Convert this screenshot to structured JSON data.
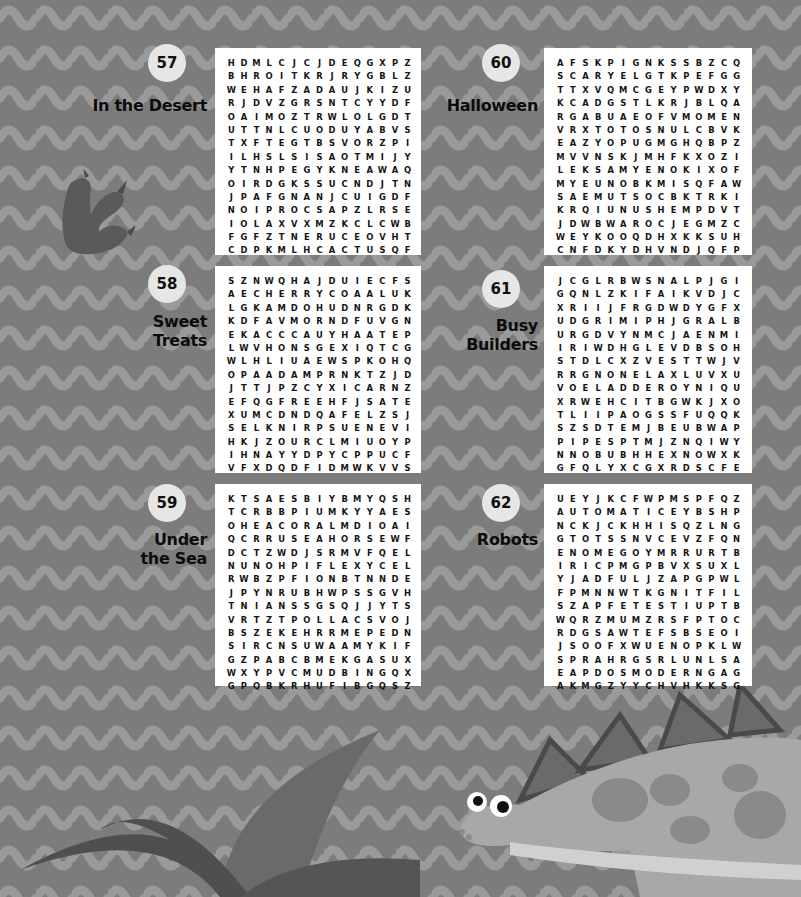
{
  "page": {
    "background_color": "#7c7c7c",
    "panel_color": "#ffffff",
    "badge_color": "#e6e6e6"
  },
  "puzzles": [
    {
      "number": "57",
      "title": "In the Desert",
      "grid": [
        "HDMLCJCJDEQGXPZ",
        "BHROITKRJRYGBLZ",
        "WEHAFZADAUJKIZU",
        "RJDVZGRSNTCYYDF",
        "OAIMOZTRWLOLGDT",
        "UTTNLCUODUYABVS",
        "TXFTEGTBSVORZPI",
        "ILHSLSISAOTMIJY",
        "YTNHPEGYKNEAWAQ",
        "OIRDGKSSUCNDJTN",
        "JPAFGNANJCUIGDF",
        "NOIPROCSAPZLRSE",
        "IOLAXVXMZKCLCWB",
        "FGFZTNERUCEOVHT",
        "CDPKMLHCACTUSQF"
      ],
      "found_words": [
        "CACTUS",
        "SCORPION",
        "OASIS",
        "CAMEL",
        "DUNE",
        "RATTLESNAKE",
        "HEAT",
        "COYOTE",
        "DRY",
        "LIZARD",
        "VULTURE",
        "DESERT",
        "SUN"
      ]
    },
    {
      "number": "58",
      "title": "Sweet Treats",
      "grid": [
        "SZNWQHAJDUIECFS",
        "AECHERRYCOAALUK",
        "LGKAMDOHUDNRGDK",
        "KDFAVMORNDFUVGN",
        "EKACCCAUYHAATEP",
        "LWVHONSGEXIQTCG",
        "WLHLIUAEWSPKOHQ",
        "OPAADAMPRNKTZJD",
        "JTTJPZCYXICARNZ",
        "EFQGFREEHFJSATE",
        "XUMCDNDQAFELZSJ",
        "SELKNIRPSUENEVI",
        "HKJZOURCLMIUOYP",
        "IHNAYYDPYCPPUCF",
        "VFXDQDFIDMWKVVS"
      ],
      "found_words": [
        "CHERRY",
        "CAKE",
        "SPRINKLES",
        "FUDGE",
        "MUFFINS",
        "PIE",
        "CANDY",
        "CUPCAKE",
        "DONUT",
        "CARAMEL",
        "SALTED",
        "ICECREAM",
        "CHOCOLATE"
      ]
    },
    {
      "number": "59",
      "title": "Under the Sea",
      "grid": [
        "KTSAESBIYBMYQSH",
        "TCRBBPIUMKYYAES",
        "OHEACORALMDIOAI",
        "QCRRUSEAHORSEWF",
        "DCTZWDJSRMVFQEL",
        "NUNOHPIFLEXYCEL",
        "RWBZPFIONBTNNDE",
        "JPYNRUBHWPSSGVH",
        "TNIANSSGSQJJYTS",
        "VRTZTPOLLACSVOJ",
        "BSZEKEHRRMEPEDN",
        "SIRCNSUWAAMYKIF",
        "GZPABCBMEKGASUX",
        "WXYPVCMUDBINGQX",
        "GPQBKRHUFIBGQSZ"
      ],
      "found_words": [
        "CORAL",
        "SEAHORSE",
        "POLLACS",
        "SEAWEED",
        "SHELLFISH",
        "SQUID",
        "OCTOPUS",
        "URCHINS",
        "STARFISH",
        "SHRIMP",
        "SPONGES"
      ]
    },
    {
      "number": "60",
      "title": "Halloween",
      "grid": [
        "AFSKPIGNKSSBZCQ",
        "SCARYELGTKPEFGG",
        "TTXVQMCGEYPWDXY",
        "KCADGSTLKRJBLQA",
        "RGABUAEOFVMOMEN",
        "VRXTOTOSNULCBVK",
        "EAZYOPUGMGHQBPZ",
        "MVVNSKJMHFKXOZI",
        "LEKSAMYENOKIXOF",
        "MYEUNOBKMISQFAW",
        "SAEMUTSOCBKTRKI",
        "KRQIUNUSHEMPDVT",
        "JDWBWAROCJEGMZC",
        "WEYKOOQDHXKKSUH",
        "CNFDKYDHVNDJQFP"
      ],
      "found_words": [
        "SCARY",
        "MASKS",
        "COSTUME",
        "GRAVEYARD",
        "WITCH",
        "WEB",
        "CAT",
        "SPOOKY",
        "GHOST",
        "MUMMY",
        "PUMPKIN",
        "BOO",
        "NIGHT"
      ]
    },
    {
      "number": "61",
      "title": "Busy Builders",
      "grid": [
        "JCGLRBWSNALPJGI",
        "GQNLZKIFAIKVDJC",
        "XRIIJFRGDWDYGFX",
        "UDGRIMIPHJGRALB",
        "URGDVYNMCJAENMI",
        "IRIWDHGLEVDBSOH",
        "STDLCXZVESTTWJV",
        "RRGNONELAXLUVXU",
        "VOELADDEROYNIQU",
        "XRWEHCITBGWKJXO",
        "TLIIPAOGSSFUQQK",
        "SZSDTEMJBEUBWAP",
        "PIPESPTMJZNQIWY",
        "NNOBUBHHEXNOWXK",
        "GFQLYXCGXRDSCFE"
      ],
      "found_words": [
        "PLANS",
        "LADDER",
        "PIPES",
        "DIGGING",
        "GRID",
        "WIRING",
        "SAW",
        "TILE",
        "GRADE",
        "WELD",
        "BRICKS",
        "BEAMS",
        "HITCH",
        "SCREWS"
      ]
    },
    {
      "number": "62",
      "title": "Robots",
      "grid": [
        "UEYJKCFWPMSPFQZ",
        "AUTOMATICEYBSHP",
        "NCKJCKHHISQZLNG",
        "GTOTSSNVCEVZFQN",
        "ENOMEGOYMRRURTB",
        "IRICPMGPBVXSUXL",
        "YJADFULJZAPGPWL",
        "FPMNNWTKGNITFIL",
        "SZAPFETESTIUPTB",
        "WQRZMUMZRSFPTOC",
        "RDGSAWTEFSBSEOI",
        "JSOOFXWUENOPKLW",
        "SPRAHRGSRLUNLSA",
        "EAPDOSMODERNGAG",
        "AKMGZYYCHVHKKSG"
      ],
      "found_words": [
        "AUTOMATIC",
        "FILTING",
        "MODERN",
        "PROGRAM",
        "TOOLS",
        "SERVES",
        "MACHINE",
        "GENIUS",
        "SPACE",
        "FUTURE",
        "TESTS",
        "COMPUTER",
        "WIRES"
      ]
    }
  ]
}
